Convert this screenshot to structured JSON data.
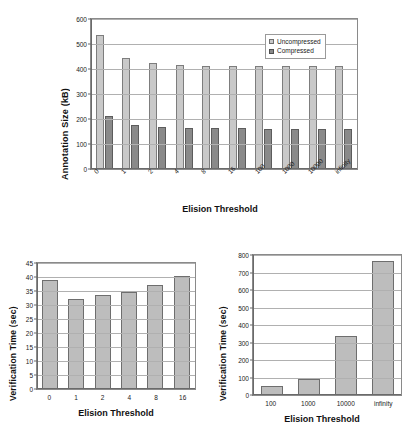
{
  "charts": [
    {
      "id": "annotation-size",
      "ylabel": "Annotation Size (kB)",
      "xlabel": "Elision Threshold",
      "yticks": [
        "0",
        "100",
        "200",
        "300",
        "400",
        "500",
        "600"
      ],
      "categories": [
        "0",
        "1",
        "2",
        "4",
        "8",
        "16",
        "100",
        "1000",
        "10000",
        "infinity"
      ],
      "legend": [
        {
          "label": "Uncompressed",
          "color": "#c9c9c9"
        },
        {
          "label": "Compressed",
          "color": "#8a8a8a"
        }
      ]
    },
    {
      "id": "verification-time-small",
      "ylabel": "Verification Time (sec)",
      "xlabel": "Elision Threshold",
      "yticks": [
        "0",
        "5",
        "10",
        "15",
        "20",
        "25",
        "30",
        "35",
        "40",
        "45"
      ],
      "categories": [
        "0",
        "1",
        "2",
        "4",
        "8",
        "16"
      ]
    },
    {
      "id": "verification-time-large",
      "ylabel": "Verification Time (sec)",
      "xlabel": "Elision Threshold",
      "yticks": [
        "0",
        "100",
        "200",
        "300",
        "400",
        "500",
        "600",
        "700",
        "800"
      ],
      "categories": [
        "100",
        "1000",
        "10000",
        "infinity"
      ]
    }
  ],
  "chart_data": [
    {
      "type": "bar",
      "id": "annotation-size",
      "title": "",
      "xlabel": "Elision Threshold",
      "ylabel": "Annotation Size (kB)",
      "categories": [
        "0",
        "1",
        "2",
        "4",
        "8",
        "16",
        "100",
        "1000",
        "10000",
        "infinity"
      ],
      "series": [
        {
          "name": "Uncompressed",
          "values": [
            536,
            446,
            425,
            418,
            414,
            414,
            412,
            412,
            412,
            412
          ],
          "color": "#c9c9c9"
        },
        {
          "name": "Compressed",
          "values": [
            212,
            175,
            167,
            164,
            163,
            163,
            162,
            162,
            162,
            162
          ],
          "color": "#8a8a8a"
        }
      ],
      "ylim": [
        0,
        600
      ],
      "ytick_step": 100,
      "grid": true,
      "legend_position": "top-right"
    },
    {
      "type": "bar",
      "id": "verification-time-small",
      "title": "",
      "xlabel": "Elision Threshold",
      "ylabel": "Verification Time (sec)",
      "categories": [
        "0",
        "1",
        "2",
        "4",
        "8",
        "16"
      ],
      "values": [
        39.0,
        32.1,
        33.7,
        34.6,
        37.2,
        40.2
      ],
      "ylim": [
        0,
        45
      ],
      "ytick_step": 5,
      "grid": true,
      "legend_position": "none"
    },
    {
      "type": "bar",
      "id": "verification-time-large",
      "title": "",
      "xlabel": "Elision Threshold",
      "ylabel": "Verification Time (sec)",
      "categories": [
        "100",
        "1000",
        "10000",
        "infinity"
      ],
      "values": [
        50,
        90,
        335,
        765
      ],
      "ylim": [
        0,
        800
      ],
      "ytick_step": 100,
      "grid": true,
      "legend_position": "none"
    }
  ]
}
